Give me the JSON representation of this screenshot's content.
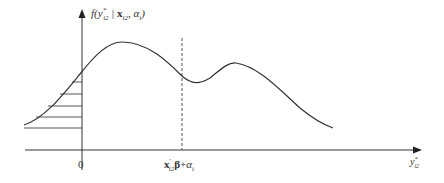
{
  "diagram": {
    "type": "density-curve",
    "y_axis_label": "f(y*_i2 | x_i2, α_i)",
    "y_axis_label_parts": {
      "f": "f(",
      "y": "y",
      "ysup": "*",
      "ysub": "i2",
      "sep": " | ",
      "x": "x",
      "xsub": "i2",
      "alpha": ", α",
      "asub": "i",
      "close": ")"
    },
    "x_axis_label": "y*_i2",
    "x_axis_label_parts": {
      "y": "y",
      "sup": "*",
      "sub": "i2"
    },
    "origin_label": "0",
    "mean_marker_label": "x'_i2 β + α_i",
    "mean_marker_parts": {
      "x": "x",
      "prime": "'",
      "sub": "i2",
      "beta": "β",
      "plus": "+",
      "alpha": "α",
      "asub": "i"
    },
    "shaded_region": "area under curve left of 0 (hatched)",
    "colors": {
      "line": "#333333",
      "background": "#ffffff"
    }
  }
}
